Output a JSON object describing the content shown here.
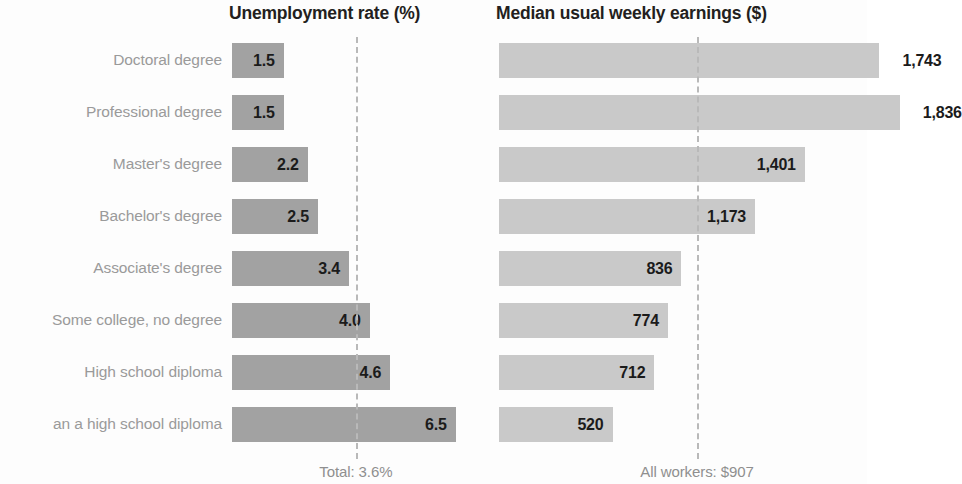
{
  "chart_data": {
    "type": "bar",
    "orientation": "horizontal",
    "layout": "two side-by-side horizontal bar panels sharing one category axis",
    "grid": false,
    "legend": null,
    "categories": [
      "Doctoral degree",
      "Professional degree",
      "Master's degree",
      "Bachelor's degree",
      "Associate's degree",
      "Some college, no degree",
      "High school diploma",
      "an a high school diploma"
    ],
    "panels": [
      {
        "id": "unemployment",
        "title": "Unemployment rate (%)",
        "bar_color": "#a2a2a2",
        "values": [
          1.5,
          1.5,
          2.2,
          2.5,
          3.4,
          4.0,
          4.6,
          6.5
        ],
        "value_labels": [
          "1.5",
          "1.5",
          "2.2",
          "2.5",
          "3.4",
          "4.0",
          "4.6",
          "6.5"
        ],
        "xlim": [
          0,
          6.8
        ],
        "reference_line": {
          "value": 3.6,
          "caption": "Total: 3.6%"
        }
      },
      {
        "id": "earnings",
        "title": "Median usual weekly earnings ($)",
        "bar_color": "#c9c9c9",
        "values": [
          1743,
          1836,
          1401,
          1173,
          836,
          774,
          712,
          520
        ],
        "value_labels": [
          "1,743",
          "1,836",
          "1,401",
          "1,173",
          "836",
          "774",
          "712",
          "520"
        ],
        "xlim": [
          0,
          1900
        ],
        "reference_line": {
          "value": 907,
          "caption": "All workers: $907"
        }
      }
    ]
  },
  "colors": {
    "bar_unemployment": "#a2a2a2",
    "bar_earnings": "#c9c9c9",
    "category_label": "#9a9a9a",
    "value_label": "#1b1b1b",
    "reference_line": "#b9b9b9",
    "title": "#231f20",
    "background": "#fdfdfd"
  }
}
